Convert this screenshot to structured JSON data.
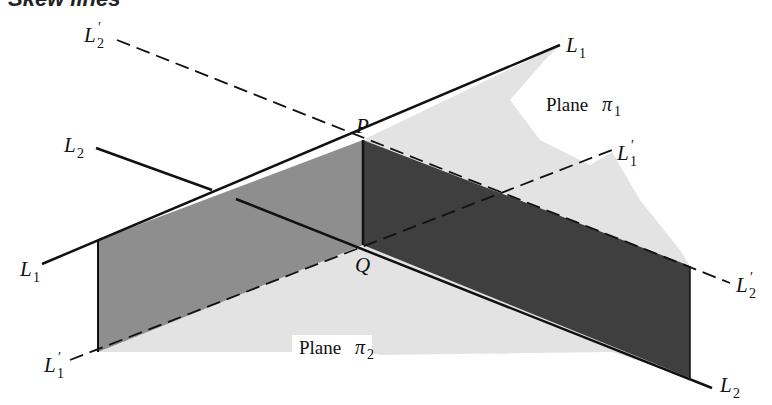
{
  "title": "Skew lines",
  "colors": {
    "background": "#ffffff",
    "plane_light": "#e3e3e3",
    "parallelogram_left": "#8e8e8e",
    "parallelogram_right": "#3f3f3f",
    "line": "#111111"
  },
  "labels": {
    "L1_top": {
      "base": "L",
      "sub": "1",
      "prime": ""
    },
    "L1_left": {
      "base": "L",
      "sub": "1",
      "prime": ""
    },
    "L2_left": {
      "base": "L",
      "sub": "2",
      "prime": ""
    },
    "L2_bottom": {
      "base": "L",
      "sub": "2",
      "prime": ""
    },
    "L2p_top": {
      "base": "L",
      "sub": "2",
      "prime": "′"
    },
    "L2p_right": {
      "base": "L",
      "sub": "2",
      "prime": "′"
    },
    "L1p_right": {
      "base": "L",
      "sub": "1",
      "prime": "′"
    },
    "L1p_left": {
      "base": "L",
      "sub": "1",
      "prime": "′"
    },
    "P": "P",
    "Q": "Q"
  },
  "planes": {
    "pi1": {
      "word": "Plane",
      "symbol": "π",
      "sub": "1"
    },
    "pi2": {
      "word": "Plane",
      "symbol": "π",
      "sub": "2"
    }
  }
}
